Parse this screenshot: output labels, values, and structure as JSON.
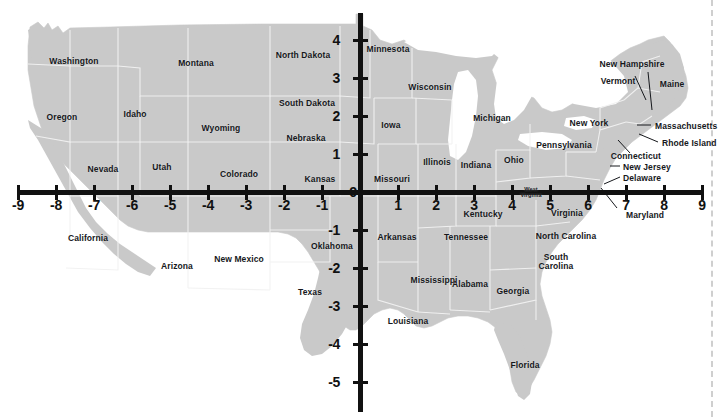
{
  "figure": {
    "kind": "map-with-cartesian-axes",
    "land_color": "#c9c9c9",
    "border_color": "#f2f2f2",
    "axis_color": "#111111",
    "label_color": "#16181c",
    "guide_color": "#cfcfcf",
    "background": "#ffffff"
  },
  "chart_data": {
    "type": "scatter",
    "title": "",
    "xlabel": "",
    "ylabel": "",
    "grid": false,
    "legend": null,
    "axis_origin_px": {
      "x": 360,
      "y": 192
    },
    "pixels_per_unit": 38,
    "xlim": [
      -9.5,
      9.5
    ],
    "ylim": [
      -5.5,
      4.5
    ],
    "x_ticks": [
      -9,
      -8,
      -7,
      -6,
      -5,
      -4,
      -3,
      -2,
      -1,
      0,
      1,
      2,
      3,
      4,
      5,
      6,
      7,
      8,
      9
    ],
    "x_tick_labels": [
      "-9",
      "-8",
      "-7",
      "-6",
      "-5",
      "-4",
      "-3",
      "-2",
      "-1",
      "0",
      "1",
      "2",
      "3",
      "4",
      "5",
      "6",
      "7",
      "8",
      "9"
    ],
    "y_ticks": [
      4,
      3,
      2,
      1,
      0,
      -1,
      -2,
      -3,
      -4,
      -5
    ],
    "y_tick_labels": [
      "4",
      "3",
      "2",
      "1",
      "0",
      "-1",
      "-2",
      "-3",
      "-4",
      "-5"
    ],
    "origin_label": "0",
    "annotations": [
      {
        "text": "West Virginia",
        "x": 4.5,
        "y": 0.1
      }
    ]
  },
  "axis": {
    "origin_label": "0",
    "x_tick_labels": [
      "-9",
      "-8",
      "-7",
      "-6",
      "-5",
      "-4",
      "-3",
      "-2",
      "-1",
      "1",
      "2",
      "3",
      "4",
      "5",
      "6",
      "7",
      "8",
      "9"
    ],
    "y_tick_labels": [
      "4",
      "3",
      "2",
      "1",
      "-1",
      "-2",
      "-3",
      "-4",
      "-5"
    ]
  },
  "states": [
    {
      "name": "Washington",
      "x": 74,
      "y": 62,
      "align": "center"
    },
    {
      "name": "Oregon",
      "x": 62,
      "y": 118,
      "align": "center"
    },
    {
      "name": "Idaho",
      "x": 135,
      "y": 115,
      "align": "center"
    },
    {
      "name": "Montana",
      "x": 196,
      "y": 64,
      "align": "center"
    },
    {
      "name": "Wyoming",
      "x": 221,
      "y": 129,
      "align": "center"
    },
    {
      "name": "Nevada",
      "x": 103,
      "y": 170,
      "align": "center"
    },
    {
      "name": "Utah",
      "x": 162,
      "y": 168,
      "align": "center"
    },
    {
      "name": "Colorado",
      "x": 239,
      "y": 175,
      "align": "center"
    },
    {
      "name": "California",
      "x": 88,
      "y": 239,
      "align": "center"
    },
    {
      "name": "Arizona",
      "x": 177,
      "y": 267,
      "align": "center"
    },
    {
      "name": "New Mexico",
      "x": 239,
      "y": 260,
      "align": "center"
    },
    {
      "name": "North Dakota",
      "x": 303,
      "y": 56,
      "align": "center"
    },
    {
      "name": "South Dakota",
      "x": 307,
      "y": 104,
      "align": "center"
    },
    {
      "name": "Nebraska",
      "x": 306,
      "y": 139,
      "align": "center"
    },
    {
      "name": "Kansas",
      "x": 320,
      "y": 180,
      "align": "center"
    },
    {
      "name": "Oklahoma",
      "x": 332,
      "y": 247,
      "align": "center"
    },
    {
      "name": "Texas",
      "x": 310,
      "y": 293,
      "align": "center"
    },
    {
      "name": "Minnesota",
      "x": 388,
      "y": 50,
      "align": "center"
    },
    {
      "name": "Iowa",
      "x": 391,
      "y": 126,
      "align": "center"
    },
    {
      "name": "Missouri",
      "x": 392,
      "y": 180,
      "align": "center"
    },
    {
      "name": "Arkansas",
      "x": 397,
      "y": 238,
      "align": "center"
    },
    {
      "name": "Louisiana",
      "x": 408,
      "y": 322,
      "align": "center"
    },
    {
      "name": "Wisconsin",
      "x": 430,
      "y": 88,
      "align": "center"
    },
    {
      "name": "Illinois",
      "x": 437,
      "y": 163,
      "align": "center"
    },
    {
      "name": "Mississippi",
      "x": 434,
      "y": 281,
      "align": "center"
    },
    {
      "name": "Michigan",
      "x": 492,
      "y": 119,
      "align": "center"
    },
    {
      "name": "Indiana",
      "x": 476,
      "y": 166,
      "align": "center"
    },
    {
      "name": "Kentucky",
      "x": 483,
      "y": 215,
      "align": "center"
    },
    {
      "name": "Tennessee",
      "x": 466,
      "y": 238,
      "align": "center"
    },
    {
      "name": "Alabama",
      "x": 470,
      "y": 285,
      "align": "center"
    },
    {
      "name": "Ohio",
      "x": 514,
      "y": 161,
      "align": "center"
    },
    {
      "name": "Georgia",
      "x": 513,
      "y": 292,
      "align": "center"
    },
    {
      "name": "Florida",
      "x": 525,
      "y": 366,
      "align": "center"
    },
    {
      "name": "West Virginia",
      "x": 531,
      "y": 192,
      "align": "center",
      "size": "tiny",
      "lines": [
        "West",
        "Virginia"
      ]
    },
    {
      "name": "Virginia",
      "x": 567,
      "y": 214,
      "align": "center"
    },
    {
      "name": "North Carolina",
      "x": 566,
      "y": 237,
      "align": "center"
    },
    {
      "name": "South Carolina",
      "x": 556,
      "y": 258,
      "align": "center",
      "lines": [
        "South",
        "Carolina"
      ]
    },
    {
      "name": "Pennsylvania",
      "x": 564,
      "y": 146,
      "align": "center"
    },
    {
      "name": "New York",
      "x": 589,
      "y": 124,
      "align": "center"
    },
    {
      "name": "Vermont",
      "x": 618,
      "y": 82,
      "align": "center"
    },
    {
      "name": "New Hampshire",
      "x": 632,
      "y": 65,
      "align": "center"
    },
    {
      "name": "Maine",
      "x": 672,
      "y": 85,
      "align": "center"
    }
  ],
  "callouts": [
    {
      "name": "Massachusetts",
      "x": 655,
      "y": 127,
      "align": "left",
      "line": [
        651,
        125,
        637,
        125
      ]
    },
    {
      "name": "Rhode Island",
      "x": 662,
      "y": 144,
      "align": "left",
      "line": [
        658,
        142,
        639,
        134
      ]
    },
    {
      "name": "Connecticut",
      "x": 661,
      "y": 157,
      "align": "right",
      "line": [
        630,
        153,
        618,
        140
      ]
    },
    {
      "name": "New Jersey",
      "x": 623,
      "y": 168,
      "align": "left",
      "line": [
        620,
        166,
        610,
        166
      ]
    },
    {
      "name": "Delaware",
      "x": 623,
      "y": 179,
      "align": "left",
      "line": [
        620,
        177,
        604,
        184
      ]
    },
    {
      "name": "Maryland",
      "x": 626,
      "y": 216,
      "align": "center",
      "line": [
        617,
        208,
        601,
        188
      ]
    }
  ]
}
